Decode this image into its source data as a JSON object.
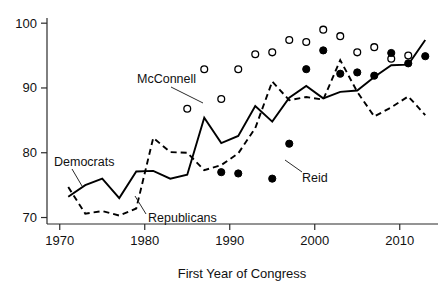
{
  "chart_data": {
    "type": "line",
    "title": "",
    "xlabel": "First Year of Congress",
    "ylabel": "",
    "xlim": [
      1968.5,
      2014.5
    ],
    "ylim": [
      69.0,
      100.8
    ],
    "grid": false,
    "legend": "inline-annotations",
    "xticks": [
      1970,
      1980,
      1990,
      2000,
      2010
    ],
    "xtick_labels": [
      "1970",
      "1980",
      "1990",
      "2000",
      "2010"
    ],
    "yticks": [
      70,
      80,
      90,
      100
    ],
    "ytick_labels": [
      "70",
      "80",
      "90",
      "100"
    ],
    "annotations": [
      {
        "text": "Democrats",
        "x": 1972.6,
        "y": 80.4
      },
      {
        "text": "Republicans",
        "x": 1982.4,
        "y": 72.0
      },
      {
        "text": "McConnell",
        "x": 1980.9,
        "y": 92.2
      },
      {
        "text": "Reid",
        "x": 1999.8,
        "y": 78.0
      }
    ],
    "series": [
      {
        "name": "Democrats",
        "style": "solid-line",
        "x": [
          1971,
          1973,
          1975,
          1977,
          1979,
          1981,
          1983,
          1985,
          1987,
          1989,
          1991,
          1993,
          1995,
          1997,
          1999,
          2001,
          2003,
          2005,
          2007,
          2009,
          2011,
          2013
        ],
        "values": [
          73.2,
          75.0,
          76.0,
          73.0,
          77.1,
          77.2,
          76.0,
          76.6,
          85.4,
          81.5,
          82.6,
          87.2,
          84.8,
          88.5,
          90.3,
          88.4,
          89.4,
          89.6,
          91.7,
          93.5,
          93.6,
          97.4
        ]
      },
      {
        "name": "Republicans",
        "style": "dashed-line",
        "x": [
          1971,
          1973,
          1975,
          1977,
          1979,
          1981,
          1983,
          1985,
          1987,
          1989,
          1991,
          1993,
          1995,
          1997,
          1999,
          2001,
          2003,
          2005,
          2007,
          2009,
          2011,
          2013
        ],
        "values": [
          74.7,
          70.6,
          71.0,
          70.3,
          71.4,
          82.3,
          80.1,
          80.0,
          77.3,
          78.1,
          79.9,
          83.8,
          91.0,
          88.1,
          88.6,
          88.2,
          94.3,
          89.4,
          85.6,
          87.0,
          88.7,
          85.8
        ]
      },
      {
        "name": "McConnell",
        "style": "open-circle",
        "x": [
          1985,
          1987,
          1989,
          1991,
          1993,
          1995,
          1997,
          1999,
          2001,
          2003,
          2005,
          2007,
          2009,
          2011
        ],
        "values": [
          86.8,
          92.9,
          88.3,
          92.9,
          95.2,
          95.5,
          97.4,
          97.1,
          99.0,
          98.0,
          95.5,
          96.3,
          94.5,
          95.0
        ]
      },
      {
        "name": "Reid",
        "style": "filled-circle",
        "x": [
          1989,
          1991,
          1995,
          1997,
          1999,
          2001,
          2003,
          2005,
          2007,
          2009,
          2011,
          2013
        ],
        "values": [
          77.0,
          76.8,
          76.0,
          81.4,
          92.9,
          95.8,
          92.2,
          92.4,
          91.9,
          95.4,
          93.8,
          94.9
        ]
      }
    ]
  },
  "axis": {
    "x_title": "First Year of Congress"
  },
  "labels": {
    "democrats": "Democrats",
    "republicans": "Republicans",
    "mcconnell": "McConnell",
    "reid": "Reid"
  },
  "colors": {
    "line": "#000000",
    "axis": "#2b2b2b",
    "background": "#ffffff",
    "text": "#111111"
  }
}
